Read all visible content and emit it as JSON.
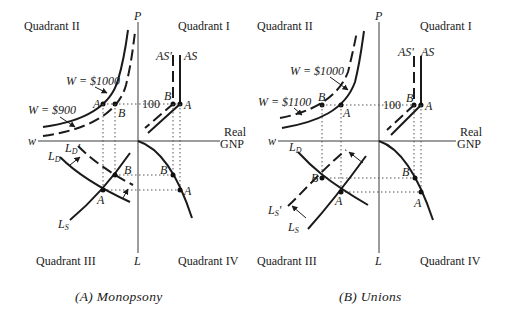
{
  "figure": {
    "panels": [
      {
        "id": "A",
        "caption": "(A) Monopsony",
        "quadrant_labels": {
          "q1": "Quadrant I",
          "q2": "Quadrant II",
          "q3": "Quadrant III",
          "q4": "Quadrant IV"
        },
        "axes": {
          "vertical_top": "P",
          "vertical_bottom": "L",
          "horizontal_left": "w",
          "horizontal_right_line1": "Real",
          "horizontal_right_line2": "GNP"
        },
        "price_level_label": "100",
        "wage_curves": [
          {
            "label": "W = $1000",
            "style": "solid"
          },
          {
            "label": "W = $900",
            "style": "dashed"
          }
        ],
        "supply_curves": [
          {
            "label": "AS'",
            "style": "dashed"
          },
          {
            "label": "AS",
            "style": "solid"
          }
        ],
        "labor_curves": [
          {
            "label": "L_D'",
            "display": "LD'",
            "style": "dashed"
          },
          {
            "label": "L_D",
            "display": "LD",
            "style": "solid"
          },
          {
            "label": "L_S",
            "display": "LS",
            "style": "solid"
          }
        ],
        "points": {
          "a": "A",
          "b": "B"
        }
      },
      {
        "id": "B",
        "caption": "(B) Unions",
        "quadrant_labels": {
          "q1": "Quadrant I",
          "q2": "Quadrant II",
          "q3": "Quadrant III",
          "q4": "Quadrant IV"
        },
        "axes": {
          "vertical_top": "P",
          "vertical_bottom": "L",
          "horizontal_left": "w",
          "horizontal_right_line1": "Real",
          "horizontal_right_line2": "GNP"
        },
        "price_level_label": "100",
        "wage_curves": [
          {
            "label": "W = $1000",
            "style": "solid"
          },
          {
            "label": "W = $1100",
            "style": "dashed"
          }
        ],
        "supply_curves": [
          {
            "label": "AS'",
            "style": "dashed"
          },
          {
            "label": "AS",
            "style": "solid"
          }
        ],
        "labor_curves": [
          {
            "label": "L_D",
            "display": "LD",
            "style": "solid"
          },
          {
            "label": "L_S'",
            "display": "LS'",
            "style": "dashed"
          },
          {
            "label": "L_S",
            "display": "LS",
            "style": "solid"
          }
        ],
        "points": {
          "a": "A",
          "b": "B"
        }
      }
    ]
  }
}
